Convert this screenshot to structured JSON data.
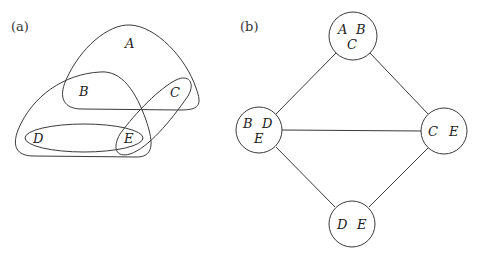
{
  "panel_a": {
    "label": "(a)",
    "vertices": [
      {
        "id": "A",
        "label": "A"
      },
      {
        "id": "B",
        "label": "B"
      },
      {
        "id": "C",
        "label": "C"
      },
      {
        "id": "D",
        "label": "D"
      },
      {
        "id": "E",
        "label": "E"
      }
    ],
    "hyperedges": [
      {
        "members": [
          "A",
          "B",
          "C"
        ]
      },
      {
        "members": [
          "B",
          "D",
          "E"
        ]
      },
      {
        "members": [
          "D",
          "E"
        ]
      },
      {
        "members": [
          "C",
          "E"
        ]
      }
    ]
  },
  "panel_b": {
    "label": "(b)",
    "nodes": [
      {
        "id": "ABC",
        "labels": [
          "A",
          "B",
          "C"
        ]
      },
      {
        "id": "BDE",
        "labels": [
          "B",
          "D",
          "E"
        ]
      },
      {
        "id": "CE",
        "labels": [
          "C",
          "E"
        ]
      },
      {
        "id": "DE",
        "labels": [
          "D",
          "E"
        ]
      }
    ],
    "edges": [
      [
        "ABC",
        "BDE"
      ],
      [
        "ABC",
        "CE"
      ],
      [
        "BDE",
        "CE"
      ],
      [
        "BDE",
        "DE"
      ],
      [
        "CE",
        "DE"
      ]
    ]
  }
}
